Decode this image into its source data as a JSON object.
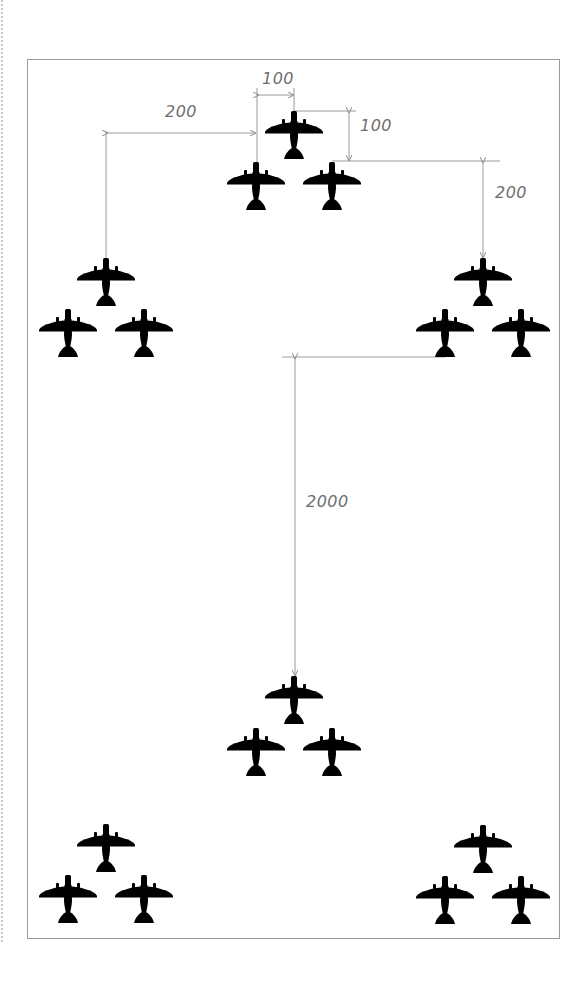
{
  "diagram": {
    "title": "",
    "type": "aircraft formation spacing diagram",
    "colors": {
      "aircraft": "#000000",
      "dimension_line": "#9a9a9a",
      "dimension_text": "#6f6f6f",
      "frame": "#9a9a9a",
      "background": "#ffffff"
    },
    "dimensions": [
      {
        "id": "lateral-in-element",
        "label": "100",
        "orientation": "horizontal"
      },
      {
        "id": "longitudinal-in-element",
        "label": "100",
        "orientation": "vertical"
      },
      {
        "id": "lateral-between-elements",
        "label": "200",
        "orientation": "horizontal"
      },
      {
        "id": "longitudinal-between-elements",
        "label": "200",
        "orientation": "vertical"
      },
      {
        "id": "longitudinal-between-flights",
        "label": "2000",
        "orientation": "vertical"
      }
    ],
    "groups": [
      {
        "name": "lead-element",
        "aircraft": 3
      },
      {
        "name": "left-element",
        "aircraft": 3
      },
      {
        "name": "right-element",
        "aircraft": 3
      },
      {
        "name": "trail-lead-element",
        "aircraft": 3
      },
      {
        "name": "trail-left-element",
        "aircraft": 3
      },
      {
        "name": "trail-right-element",
        "aircraft": 3
      }
    ],
    "aircraft_icon": "airplane-silhouette-icon"
  }
}
